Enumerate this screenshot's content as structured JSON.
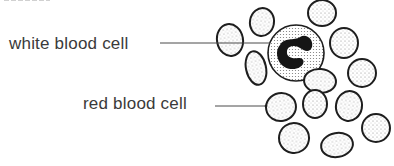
{
  "figure": {
    "labels": {
      "white_blood_cell": "white blood cell",
      "red_blood_cell": "red blood cell"
    },
    "colors": {
      "outline": "#1e1e1e",
      "stipple": "#8a8a8a",
      "nucleus": "#151515",
      "text": "#3a3a3a",
      "leader_line": "#4a4a4a"
    },
    "red_blood_cells": [
      {
        "cx": 230,
        "cy": 40,
        "rx": 13,
        "ry": 16,
        "rot": -10
      },
      {
        "cx": 262,
        "cy": 22,
        "rx": 12,
        "ry": 14,
        "rot": 10
      },
      {
        "cx": 322,
        "cy": 13,
        "rx": 14,
        "ry": 13,
        "rot": 0
      },
      {
        "cx": 256,
        "cy": 68,
        "rx": 10,
        "ry": 17,
        "rot": -12
      },
      {
        "cx": 344,
        "cy": 43,
        "rx": 14,
        "ry": 15,
        "rot": 0
      },
      {
        "cx": 362,
        "cy": 73,
        "rx": 14,
        "ry": 14,
        "rot": 0
      },
      {
        "cx": 320,
        "cy": 81,
        "rx": 16,
        "ry": 12,
        "rot": 5
      },
      {
        "cx": 281,
        "cy": 107,
        "rx": 15,
        "ry": 14,
        "rot": -10
      },
      {
        "cx": 315,
        "cy": 104,
        "rx": 12,
        "ry": 14,
        "rot": 0
      },
      {
        "cx": 349,
        "cy": 106,
        "rx": 13,
        "ry": 15,
        "rot": 10
      },
      {
        "cx": 376,
        "cy": 128,
        "rx": 14,
        "ry": 14,
        "rot": 0
      },
      {
        "cx": 294,
        "cy": 138,
        "rx": 15,
        "ry": 15,
        "rot": 10
      },
      {
        "cx": 337,
        "cy": 145,
        "rx": 16,
        "ry": 12,
        "rot": -10
      }
    ],
    "white_blood_cell": {
      "cx": 296,
      "cy": 53,
      "r": 28
    }
  }
}
